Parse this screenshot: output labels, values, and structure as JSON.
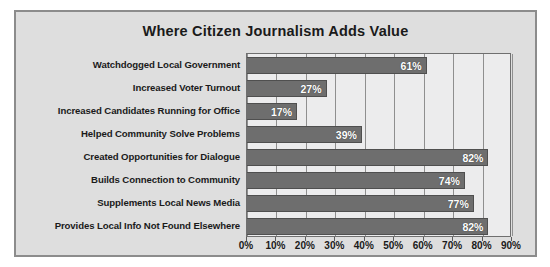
{
  "chart_data": {
    "type": "bar",
    "orientation": "horizontal",
    "title": "Where Citizen Journalism Adds Value",
    "xlabel": "",
    "ylabel": "",
    "categories": [
      "Watchdogged Local Government",
      "Increased Voter Turnout",
      "Increased Candidates Running for Office",
      "Helped Community Solve Problems",
      "Created Opportunities for Dialogue",
      "Builds Connection to Community",
      "Supplements Local News Media",
      "Provides Local Info Not Found Elsewhere"
    ],
    "values": [
      61,
      27,
      17,
      39,
      82,
      74,
      77,
      82
    ],
    "data_labels": [
      "61%",
      "27%",
      "17%",
      "39%",
      "82%",
      "74%",
      "77%",
      "82%"
    ],
    "xlim": [
      0,
      90
    ],
    "xticks": [
      0,
      10,
      20,
      30,
      40,
      50,
      60,
      70,
      80,
      90
    ],
    "xtick_labels": [
      "0%",
      "10%",
      "20%",
      "30%",
      "40%",
      "50%",
      "60%",
      "70%",
      "80%",
      "90%"
    ],
    "grid": true,
    "grid_axis": "x",
    "legend": null,
    "colors": {
      "bar_fill": "#6e6e6e",
      "bar_edge": "#4f4f4f",
      "plot_background": "#ececed",
      "figure_background": "#dedede",
      "gridline": "#8f8f8f",
      "text": "#1a1a1a",
      "data_label_text": "#ffffff",
      "panel_border": "#8c8c8c"
    }
  }
}
